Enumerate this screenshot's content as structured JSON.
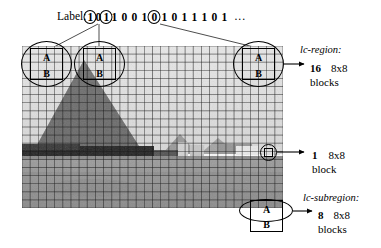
{
  "figure": {
    "label_prefix": "Label:",
    "bit_sequence": [
      {
        "v": "1",
        "circled": true
      },
      {
        "v": "0",
        "circled": false
      },
      {
        "v": "1",
        "circled": true
      },
      {
        "v": "1",
        "circled": false
      },
      {
        "v": "0",
        "circled": false
      },
      {
        "v": "0",
        "circled": false
      },
      {
        "v": "1",
        "circled": false
      },
      {
        "v": "0",
        "circled": true
      },
      {
        "v": "1",
        "circled": false
      },
      {
        "v": "0",
        "circled": false
      },
      {
        "v": "1",
        "circled": false
      },
      {
        "v": "1",
        "circled": false
      },
      {
        "v": "1",
        "circled": false
      },
      {
        "v": "0",
        "circled": false
      },
      {
        "v": "1",
        "circled": false
      }
    ],
    "ellipsis": "...",
    "block_letters": {
      "top": "A",
      "bottom": "B"
    },
    "grid": {
      "columns": 32,
      "rows": 20
    }
  },
  "annotations": {
    "lc_region": {
      "title": "lc-region:",
      "count": "16",
      "size": "8x8",
      "unit": "blocks"
    },
    "single_block": {
      "title": "",
      "count": "1",
      "size": "8x8",
      "unit": "block"
    },
    "lc_subregion": {
      "title": "lc-subregion:",
      "count": "8",
      "size": "8x8",
      "unit": "blocks"
    }
  },
  "colors": {
    "line": "#000000",
    "background": "#ffffff",
    "sky": "#e8e8e8",
    "hill": "#8a8a8a",
    "field": "#9a9a9a",
    "darkband": "#2e2e2e"
  }
}
